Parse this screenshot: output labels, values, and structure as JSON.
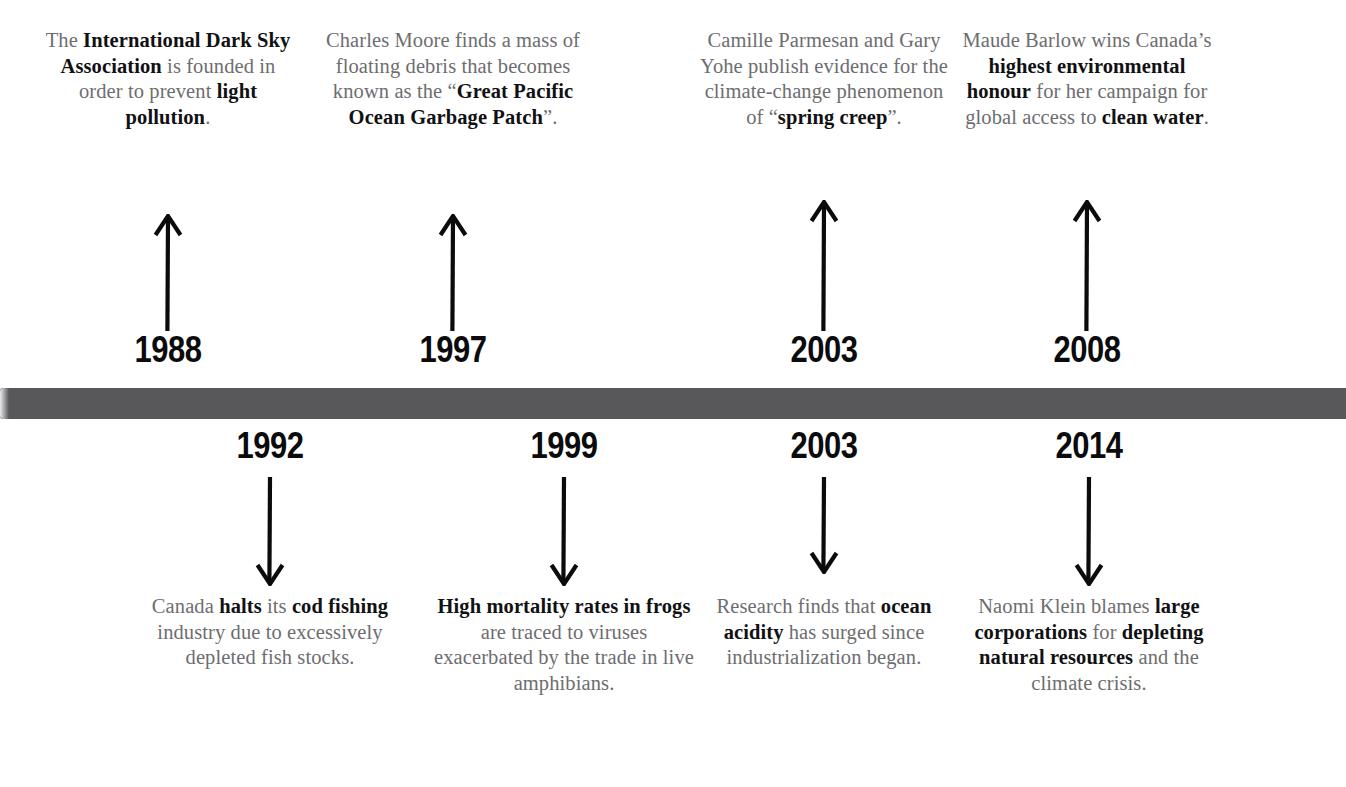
{
  "meta": {
    "bar_color": "#58585a",
    "body_text_color": "#6d6d70",
    "emphasis_color": "#111113",
    "background_color": "#ffffff"
  },
  "timeline": {
    "above": [
      {
        "year": "1988",
        "arrow": "arrow-up-icon",
        "text_runs": [
          {
            "text": "The ",
            "bold": false
          },
          {
            "text": "International Dark Sky Association",
            "bold": true
          },
          {
            "text": " is founded in order to prevent ",
            "bold": false
          },
          {
            "text": "light pollution",
            "bold": true
          },
          {
            "text": ".",
            "bold": false
          }
        ],
        "plain_text": "The International Dark Sky Association is founded in order to prevent light pollution."
      },
      {
        "year": "1997",
        "arrow": "arrow-up-icon",
        "text_runs": [
          {
            "text": "Charles Moore finds a mass of floating debris that becomes known as the “",
            "bold": false
          },
          {
            "text": "Great Pacific Ocean Garbage Patch",
            "bold": true
          },
          {
            "text": "”.",
            "bold": false
          }
        ],
        "plain_text": "Charles Moore finds a mass of floating debris that becomes known as the “Great Pacific Ocean Garbage Patch”."
      },
      {
        "year": "2003",
        "arrow": "arrow-up-icon",
        "text_runs": [
          {
            "text": "Camille Parmesan and Gary Yohe publish evidence for the climate-change phenomenon of “",
            "bold": false
          },
          {
            "text": "spring creep",
            "bold": true
          },
          {
            "text": "”.",
            "bold": false
          }
        ],
        "plain_text": "Camille Parmesan and Gary Yohe publish evidence for the climate-change phenomenon of “spring creep”."
      },
      {
        "year": "2008",
        "arrow": "arrow-up-icon",
        "text_runs": [
          {
            "text": "Maude Barlow wins Canada’s ",
            "bold": false
          },
          {
            "text": "highest environmental honour",
            "bold": true
          },
          {
            "text": " for her campaign for global access to ",
            "bold": false
          },
          {
            "text": "clean water",
            "bold": true
          },
          {
            "text": ".",
            "bold": false
          }
        ],
        "plain_text": "Maude Barlow wins Canada’s highest environmental honour for her campaign for global access to clean water."
      }
    ],
    "below": [
      {
        "year": "1992",
        "arrow": "arrow-down-icon",
        "text_runs": [
          {
            "text": "Canada ",
            "bold": false
          },
          {
            "text": "halts",
            "bold": true
          },
          {
            "text": " its ",
            "bold": false
          },
          {
            "text": "cod fishing",
            "bold": true
          },
          {
            "text": " industry due to excessively depleted fish stocks.",
            "bold": false
          }
        ],
        "plain_text": "Canada halts its cod fishing industry due to excessively depleted fish stocks."
      },
      {
        "year": "1999",
        "arrow": "arrow-down-icon",
        "text_runs": [
          {
            "text": "High mortality rates in frogs",
            "bold": true
          },
          {
            "text": " are traced to viruses exacerbated by the trade in live amphibians.",
            "bold": false
          }
        ],
        "plain_text": "High mortality rates in frogs are traced to viruses exacerbated by the trade in live amphibians."
      },
      {
        "year": "2003",
        "arrow": "arrow-down-icon",
        "text_runs": [
          {
            "text": "Research finds that ",
            "bold": false
          },
          {
            "text": "ocean acidity",
            "bold": true
          },
          {
            "text": " has surged since industrialization began.",
            "bold": false
          }
        ],
        "plain_text": "Research finds that ocean acidity has surged since industrialization began."
      },
      {
        "year": "2014",
        "arrow": "arrow-down-icon",
        "text_runs": [
          {
            "text": "Naomi Klein blames ",
            "bold": false
          },
          {
            "text": "large corporations",
            "bold": true
          },
          {
            "text": " for ",
            "bold": false
          },
          {
            "text": "depleting natural resources",
            "bold": true
          },
          {
            "text": " and the climate crisis.",
            "bold": false
          }
        ],
        "plain_text": "Naomi Klein blames large corporations for depleting natural resources and the climate crisis."
      }
    ]
  },
  "layout": {
    "above_positions": [
      {
        "center_x": 168,
        "block_left": 40,
        "block_width": 256,
        "blurb_top": 28,
        "arrow_top": 214,
        "arrow_height": 118,
        "year_top": 332
      },
      {
        "center_x": 452,
        "block_left": 326,
        "block_width": 254,
        "blurb_top": 28,
        "arrow_top": 214,
        "arrow_height": 118,
        "year_top": 332
      },
      {
        "center_x": 822,
        "block_left": 700,
        "block_width": 248,
        "blurb_top": 28,
        "arrow_top": 200,
        "arrow_height": 132,
        "year_top": 332
      },
      {
        "center_x": 1082,
        "block_left": 962,
        "block_width": 250,
        "blurb_top": 28,
        "arrow_top": 200,
        "arrow_height": 132,
        "year_top": 332
      }
    ],
    "below_positions": [
      {
        "center_x": 268,
        "block_left": 146,
        "block_width": 248,
        "year_top": 428,
        "arrow_top": 478,
        "arrow_height": 110,
        "blurb_top": 608
      },
      {
        "center_x": 563,
        "block_left": 433,
        "block_width": 262,
        "year_top": 428,
        "arrow_top": 478,
        "arrow_height": 110,
        "blurb_top": 608
      },
      {
        "center_x": 822,
        "block_left": 700,
        "block_width": 248,
        "year_top": 428,
        "arrow_top": 478,
        "arrow_height": 98,
        "blurb_top": 608
      },
      {
        "center_x": 1088,
        "block_left": 952,
        "block_width": 274,
        "year_top": 428,
        "arrow_top": 478,
        "arrow_height": 110,
        "blurb_top": 608
      }
    ]
  }
}
